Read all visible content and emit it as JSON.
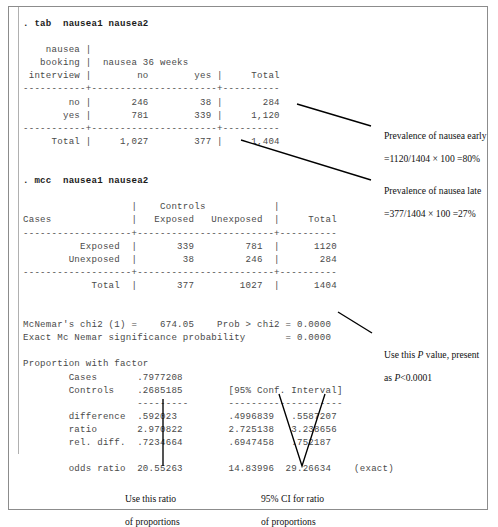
{
  "figure": {
    "clipped_top_line": "                                                  ",
    "stata_output": [
      {
        "type": "command",
        "text": ". tab  nausea1 nausea2"
      },
      {
        "type": "blank",
        "text": ""
      },
      {
        "type": "out",
        "text": "    nausea |"
      },
      {
        "type": "out",
        "text": "   booking |  nausea 36 weeks"
      },
      {
        "type": "out",
        "text": " interview |        no        yes |     Total"
      },
      {
        "type": "out",
        "text": "-----------+----------------------+----------"
      },
      {
        "type": "out",
        "text": "        no |       246         38 |       284"
      },
      {
        "type": "out",
        "text": "       yes |       781        339 |     1,120"
      },
      {
        "type": "out",
        "text": "-----------+----------------------+----------"
      },
      {
        "type": "out",
        "text": "     Total |     1,027        377 |     1,404"
      },
      {
        "type": "blank",
        "text": ""
      },
      {
        "type": "blank",
        "text": ""
      },
      {
        "type": "command",
        "text": ". mcc  nausea1 nausea2"
      },
      {
        "type": "blank",
        "text": ""
      },
      {
        "type": "out",
        "text": "                   |    Controls            |"
      },
      {
        "type": "out",
        "text": "Cases              |   Exposed   Unexposed  |     Total"
      },
      {
        "type": "out",
        "text": "-------------------+------------------------+----------"
      },
      {
        "type": "out",
        "text": "          Exposed  |       339         781  |      1120"
      },
      {
        "type": "out",
        "text": "        Unexposed  |        38         246  |       284"
      },
      {
        "type": "out",
        "text": "-------------------+------------------------+----------"
      },
      {
        "type": "out",
        "text": "            Total  |       377        1027  |      1404"
      },
      {
        "type": "blank",
        "text": ""
      },
      {
        "type": "blank",
        "text": ""
      },
      {
        "type": "out",
        "text": "McNemar's chi2 (1) =    674.05    Prob > chi2 = 0.0000"
      },
      {
        "type": "out",
        "text": "Exact Mc Nemar significance probability       = 0.0000"
      },
      {
        "type": "blank",
        "text": ""
      },
      {
        "type": "out",
        "text": "Proportion with factor"
      },
      {
        "type": "out",
        "text": "        Cases       .7977208"
      },
      {
        "type": "out",
        "text": "        Controls    .2685185        [95% Conf. Interval]"
      },
      {
        "type": "out",
        "text": "                    ---------       --------------------"
      },
      {
        "type": "out",
        "text": "        difference  .592023         .4996839   .5587207"
      },
      {
        "type": "out",
        "text": "        ratio       2.970822        2.725138   3.238656"
      },
      {
        "type": "out",
        "text": "        rel. diff.  .7234664        .6947458   .752187"
      },
      {
        "type": "blank",
        "text": ""
      },
      {
        "type": "out",
        "text": "        odds ratio  20.55263        14.83996  29.26634    (exact)"
      }
    ],
    "tab_table": {
      "row_var_label": [
        "nausea",
        "booking",
        "interview"
      ],
      "col_var_label": "nausea 36 weeks",
      "column_headers": [
        "no",
        "yes",
        "Total"
      ],
      "rows": [
        {
          "label": "no",
          "cells": [
            "246",
            "38",
            "284"
          ]
        },
        {
          "label": "yes",
          "cells": [
            "781",
            "339",
            "1,120"
          ]
        },
        {
          "label": "Total",
          "cells": [
            "1,027",
            "377",
            "1,404"
          ]
        }
      ]
    },
    "mcc_table": {
      "corner_label": "Cases",
      "group_header": "Controls",
      "column_headers": [
        "Exposed",
        "Unexposed",
        "Total"
      ],
      "rows": [
        {
          "label": "Exposed",
          "cells": [
            "339",
            "781",
            "1120"
          ]
        },
        {
          "label": "Unexposed",
          "cells": [
            "38",
            "246",
            "284"
          ]
        },
        {
          "label": "Total",
          "cells": [
            "377",
            "1027",
            "1404"
          ]
        }
      ]
    },
    "statistics": {
      "mcnemar_chi2_label": "McNemar's chi2 (1) =",
      "mcnemar_chi2_value": "674.05",
      "prob_label": "Prob > chi2 =",
      "prob_value": "0.0000",
      "exact_label": "Exact Mc Nemar significance probability",
      "exact_value": "0.0000",
      "proportion_header": "Proportion with factor",
      "ci_header": "[95% Conf. Interval]",
      "proportions": [
        {
          "label": "Cases",
          "estimate": ".7977208",
          "lower": "",
          "upper": ""
        },
        {
          "label": "Controls",
          "estimate": ".2685185",
          "lower": "",
          "upper": ""
        }
      ],
      "measures": [
        {
          "label": "difference",
          "estimate": ".592023",
          "lower": ".4996839",
          "upper": ".5587207"
        },
        {
          "label": "ratio",
          "estimate": "2.970822",
          "lower": "2.725138",
          "upper": "3.238656"
        },
        {
          "label": "rel. diff.",
          "estimate": ".7234664",
          "lower": ".6947458",
          "upper": ".752187"
        },
        {
          "label": "odds ratio",
          "estimate": "20.55263",
          "lower": "14.83996",
          "upper": "29.26634",
          "note": "(exact)"
        }
      ]
    },
    "annotations": {
      "prevalence_early_line1": "Prevalence of nausea early",
      "prevalence_early_line2": "=1120/1404 × 100 =80%",
      "prevalence_late_line1": "Prevalence of nausea late",
      "prevalence_late_line2": "=377/1404 × 100 =27%",
      "pvalue_line1_pre": "Use this ",
      "pvalue_line1_italic": "P",
      "pvalue_line1_post": " value, present",
      "pvalue_line2_pre": "as ",
      "pvalue_line2_italic": "P",
      "pvalue_line2_post": "<0.0001",
      "ratio_line1": "Use this ratio",
      "ratio_line2": "of proportions",
      "ci_line1": "95% CI for ratio",
      "ci_line2": "of proportions"
    },
    "colors": {
      "frame_border": "#8c8c8c",
      "console_text": "#4a4a4a",
      "command_text": "#1b1b1b",
      "annotation_text": "#111111",
      "leader_line": "#000000"
    }
  }
}
